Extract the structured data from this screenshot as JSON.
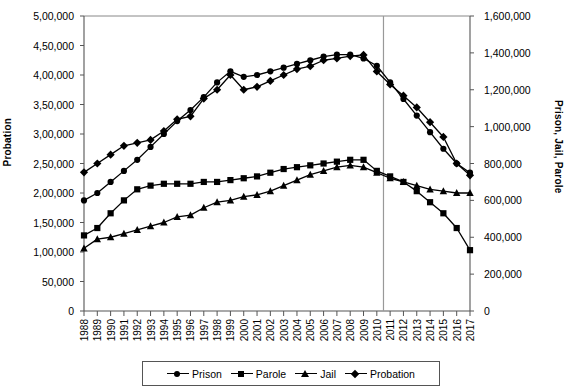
{
  "chart": {
    "type": "line",
    "ylabel_left": "Probation",
    "ylabel_right": "Prison, Jail, Parole",
    "xlabel": "",
    "title": "",
    "grid": false,
    "legend_position": "bottom",
    "ylim_left": [
      0,
      500000
    ],
    "ylim_right": [
      0,
      1600000
    ],
    "yticks_left": [
      "0",
      "50,000",
      "1,00,000",
      "1,50,000",
      "2,00,000",
      "2,50,000",
      "3,00,000",
      "3,50,000",
      "4,00,000",
      "4,50,000",
      "5,00,000"
    ],
    "ytick_values_left": [
      0,
      50000,
      100000,
      150000,
      200000,
      250000,
      300000,
      350000,
      400000,
      450000,
      500000
    ],
    "yticks_right": [
      "0",
      "200,000",
      "400,000",
      "600,000",
      "800,000",
      "1,000,000",
      "1,200,000",
      "1,400,000",
      "1,600,000"
    ],
    "ytick_values_right": [
      0,
      200000,
      400000,
      600000,
      800000,
      1000000,
      1200000,
      1400000,
      1600000
    ],
    "categories": [
      "1988",
      "1989",
      "1990",
      "1991",
      "1992",
      "1993",
      "1994",
      "1995",
      "1996",
      "1997",
      "1998",
      "1999",
      "2000",
      "2001",
      "2002",
      "2003",
      "2004",
      "2005",
      "2006",
      "2007",
      "2008",
      "2009",
      "2010",
      "2011",
      "2012",
      "2013",
      "2014",
      "2015",
      "2016",
      "2017"
    ],
    "annotation_line_after": "2010",
    "series": [
      {
        "name": "Prison",
        "marker": "circle",
        "axis": "right",
        "values": [
          600000,
          640000,
          700000,
          760000,
          820000,
          890000,
          960000,
          1030000,
          1090000,
          1160000,
          1240000,
          1300000,
          1270000,
          1280000,
          1300000,
          1320000,
          1340000,
          1360000,
          1380000,
          1390000,
          1390000,
          1370000,
          1330000,
          1240000,
          1150000,
          1060000,
          970000,
          880000,
          800000,
          750000
        ]
      },
      {
        "name": "Parole",
        "marker": "square",
        "axis": "right",
        "values": [
          410000,
          450000,
          530000,
          600000,
          660000,
          680000,
          690000,
          690000,
          690000,
          700000,
          700000,
          710000,
          720000,
          730000,
          750000,
          770000,
          780000,
          790000,
          800000,
          810000,
          820000,
          820000,
          760000,
          730000,
          700000,
          650000,
          590000,
          530000,
          450000,
          330000
        ]
      },
      {
        "name": "Jail",
        "marker": "triangle",
        "axis": "right",
        "values": [
          340000,
          390000,
          400000,
          420000,
          440000,
          460000,
          480000,
          510000,
          520000,
          560000,
          590000,
          600000,
          620000,
          630000,
          650000,
          680000,
          710000,
          740000,
          760000,
          780000,
          790000,
          780000,
          750000,
          720000,
          700000,
          680000,
          660000,
          650000,
          640000,
          640000
        ]
      },
      {
        "name": "Probation",
        "marker": "diamond",
        "axis": "left",
        "values": [
          235000,
          250000,
          265000,
          280000,
          285000,
          290000,
          305000,
          325000,
          330000,
          360000,
          375000,
          400000,
          375000,
          380000,
          390000,
          400000,
          410000,
          415000,
          425000,
          428000,
          432000,
          434000,
          406000,
          384000,
          365000,
          345000,
          320000,
          295000,
          250000,
          230000
        ]
      }
    ]
  }
}
